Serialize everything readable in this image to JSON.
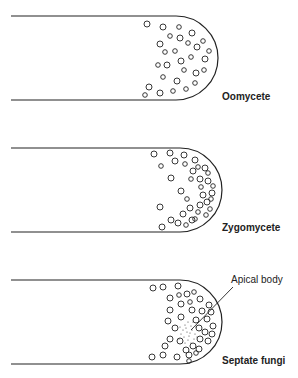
{
  "figure": {
    "panels": [
      {
        "label": "Oomycete"
      },
      {
        "label": "Zygomycete"
      },
      {
        "label": "Septate fungi",
        "annotation": "Apical body"
      }
    ]
  },
  "colors": {
    "ink": "#222222",
    "background": "#ffffff"
  }
}
